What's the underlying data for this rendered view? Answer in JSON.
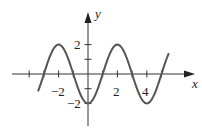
{
  "chart_data": {
    "type": "line",
    "title": "",
    "xlabel": "x",
    "ylabel": "y",
    "function": "y = -2cos(πx/2)",
    "x_ticks": [
      -4,
      -3,
      -2,
      -1,
      1,
      2,
      3,
      4,
      5
    ],
    "x_tick_labels": [
      "-2",
      "2",
      "4"
    ],
    "y_ticks": [
      -2,
      -1,
      1,
      2
    ],
    "y_tick_labels": [
      "2",
      "-2"
    ],
    "xlim": [
      -5.2,
      7.5
    ],
    "ylim": [
      -3.2,
      3.6
    ],
    "x_domain": [
      -3.4,
      5.5
    ],
    "x": [
      -3,
      -2,
      -1,
      0,
      1,
      2,
      3,
      4,
      5
    ],
    "y": [
      0,
      2,
      0,
      -2,
      0,
      2,
      0,
      -2,
      0
    ],
    "grid": false,
    "legend": false
  },
  "labels": {
    "x_axis": "x",
    "y_axis": "y",
    "x_neg2": "−2",
    "x_2": "2",
    "x_4": "4",
    "y_2": "2",
    "y_neg2": "−2"
  },
  "colors": {
    "curve": "#555555",
    "axis": "#222222"
  }
}
